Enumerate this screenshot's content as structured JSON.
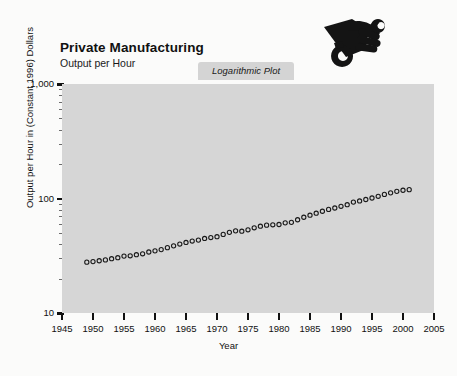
{
  "header": {
    "title": "Private Manufacturing",
    "subtitle": "Output per Hour",
    "badge_label": "Logarithmic Plot",
    "brand_icon": "hand-holding-wrench-icon"
  },
  "colors": {
    "plot_background": "#d6d6d6",
    "page_background": "#fbfbfa",
    "badge_background": "#d4d4d4",
    "marker_stroke": "#1a1a1a",
    "axis": "#111111"
  },
  "chart_data": {
    "type": "scatter",
    "title": "Private Manufacturing",
    "subtitle": "Output per Hour",
    "annotation": "Logarithmic Plot",
    "xlabel": "Year",
    "ylabel": "Output per Hour in (Constant 1996) Dollars",
    "xlim": [
      1945,
      2005
    ],
    "ylim": [
      10,
      1000
    ],
    "yscale": "log",
    "grid": false,
    "legend": false,
    "marker": "open-circle",
    "xticks": [
      1945,
      1950,
      1955,
      1960,
      1965,
      1970,
      1975,
      1980,
      1985,
      1990,
      1995,
      2000,
      2005
    ],
    "xtick_labels": [
      "1945",
      "1950",
      "1955",
      "1960",
      "1965",
      "1970",
      "1975",
      "1980",
      "1985",
      "1990",
      "1995",
      "2000",
      "2005"
    ],
    "yticks": [
      10,
      100,
      1000
    ],
    "ytick_labels": [
      "10",
      "100",
      "1,000"
    ],
    "x": [
      1949,
      1950,
      1951,
      1952,
      1953,
      1954,
      1955,
      1956,
      1957,
      1958,
      1959,
      1960,
      1961,
      1962,
      1963,
      1964,
      1965,
      1966,
      1967,
      1968,
      1969,
      1970,
      1971,
      1972,
      1973,
      1974,
      1975,
      1976,
      1977,
      1978,
      1979,
      1980,
      1981,
      1982,
      1983,
      1984,
      1985,
      1986,
      1987,
      1988,
      1989,
      1990,
      1991,
      1992,
      1993,
      1994,
      1995,
      1996,
      1997,
      1998,
      1999,
      2000,
      2001
    ],
    "values": [
      27.8,
      28.1,
      28.6,
      29.1,
      29.8,
      30.4,
      31.4,
      31.6,
      32.3,
      32.9,
      34.1,
      34.9,
      35.8,
      37.2,
      38.6,
      40.0,
      41.3,
      42.5,
      43.3,
      44.8,
      45.6,
      46.4,
      48.6,
      50.6,
      52.2,
      51.8,
      53.3,
      55.5,
      57.3,
      58.5,
      58.9,
      59.3,
      61.3,
      61.9,
      65.2,
      68.6,
      71.5,
      74.4,
      77.4,
      80.3,
      82.6,
      85.5,
      88.3,
      93.0,
      95.2,
      98.0,
      101.0,
      104.5,
      108.6,
      112.0,
      115.5,
      118.0,
      119.5
    ]
  },
  "axes": {
    "y_title": "Output per Hour in (Constant 1996) Dollars",
    "x_title": "Year"
  }
}
